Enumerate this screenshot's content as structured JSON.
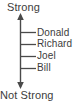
{
  "diagram": {
    "type": "vertical-scale-axis",
    "top_label": "Strong",
    "bottom_label": "Not Strong",
    "line_color": "#4a4a4a",
    "text_color": "#3c3c3c",
    "background_color": "#ffffff",
    "axis": {
      "has_top_arrowhead": true,
      "has_bottom_arrowhead": true,
      "x": 20,
      "y_top": 14,
      "y_bottom": 88
    },
    "ticks": [
      {
        "label": "Donald",
        "y": 32
      },
      {
        "label": "Richard",
        "y": 44
      },
      {
        "label": "Joel",
        "y": 56
      },
      {
        "label": "Bill",
        "y": 68
      }
    ]
  }
}
